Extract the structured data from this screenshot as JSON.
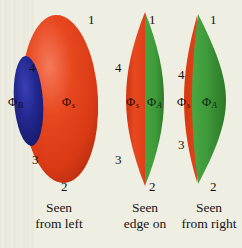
{
  "figure": {
    "background_color": "#efeee3",
    "colors": {
      "red": "#e2401c",
      "red_shade_dark": "#b82c10",
      "red_highlight": "#f2694a",
      "blue": "#1f2390",
      "blue_shade_dark": "#141860",
      "green": "#3f9b3a",
      "green_shade_dark": "#2c7528",
      "green_highlight": "#63b75c",
      "label_text": "#14110f"
    },
    "panels": [
      {
        "id": "seen-from-left",
        "caption_line1": "Seen",
        "caption_line2": "from left",
        "vertex_labels": [
          "1",
          "4",
          "3",
          "2"
        ],
        "region_labels": [
          {
            "text": "Φ",
            "subscript": "B",
            "on": "background"
          },
          {
            "text": "Φ",
            "subscript": "s",
            "on": "red"
          }
        ]
      },
      {
        "id": "seen-edge-on",
        "caption_line1": "Seen",
        "caption_line2": "edge on",
        "vertex_labels": [
          "1",
          "4",
          "3",
          "2"
        ],
        "region_labels": [
          {
            "text": "Φ",
            "subscript": "s",
            "on": "red"
          },
          {
            "text": "Φ",
            "subscript": "A",
            "on": "green"
          }
        ]
      },
      {
        "id": "seen-from-right",
        "caption_line1": "Seen",
        "caption_line2": "from right",
        "vertex_labels": [
          "1",
          "4",
          "3",
          "2"
        ],
        "region_labels": [
          {
            "text": "Φ",
            "subscript": "s",
            "on": "red"
          },
          {
            "text": "Φ",
            "subscript": "A",
            "on": "green"
          }
        ]
      }
    ]
  }
}
